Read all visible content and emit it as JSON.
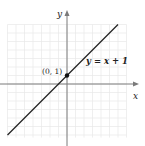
{
  "chart_data": {
    "type": "line",
    "title": "",
    "xlabel": "x",
    "ylabel": "y",
    "grid": true,
    "xlim": [
      -7,
      7
    ],
    "ylim": [
      -7,
      7
    ],
    "series": [
      {
        "name": "y = x + 1",
        "equation": "y = x + 1",
        "slope": 1,
        "intercept": 1,
        "x": [
          -7,
          6
        ],
        "y": [
          -6,
          7
        ]
      }
    ],
    "points": [
      {
        "label": "(0, 1)",
        "x": 0,
        "y": 1
      }
    ],
    "annotations": [
      {
        "text": "y = x + 1",
        "x": 4.5,
        "y": 4.5
      },
      {
        "text": "(0, 1)",
        "x": -2.5,
        "y": 1.5
      }
    ]
  },
  "labels": {
    "x_axis": "x",
    "y_axis": "y",
    "equation": "y = x + 1",
    "point": "(0, 1)"
  },
  "colors": {
    "grid": "#e8e8e8",
    "axis": "#777777",
    "line": "#222222",
    "point": "#111111"
  }
}
